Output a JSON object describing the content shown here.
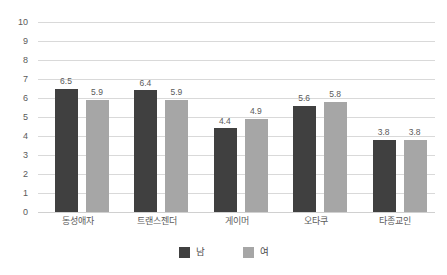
{
  "chart_data": {
    "type": "bar",
    "title": "",
    "subtitle": "",
    "xlabel": "",
    "ylabel": "",
    "ylim": [
      0,
      10
    ],
    "ytick_labels": [
      "10",
      "9",
      "8",
      "7",
      "6",
      "5",
      "4",
      "3",
      "2",
      "1",
      "0"
    ],
    "ytick_values": [
      10,
      9,
      8,
      7,
      6,
      5,
      4,
      3,
      2,
      1,
      0
    ],
    "grid": true,
    "legend_position": "bottom",
    "categories": [
      "동성애자",
      "트랜스젠더",
      "게이머",
      "오타쿠",
      "타종교인"
    ],
    "series": [
      {
        "name": "남",
        "color": "#404040",
        "values": [
          6.5,
          6.4,
          4.4,
          5.6,
          3.8
        ],
        "labels": [
          "6.5",
          "6.4",
          "4.4",
          "5.6",
          "3.8"
        ]
      },
      {
        "name": "여",
        "color": "#a6a6a6",
        "values": [
          5.9,
          5.9,
          4.9,
          5.8,
          3.8
        ],
        "labels": [
          "5.9",
          "5.9",
          "4.9",
          "5.8",
          "3.8"
        ]
      }
    ]
  },
  "colors": {
    "male": "#404040",
    "female": "#a6a6a6",
    "gridline": "#d9d9d9",
    "text": "#5a5a5a",
    "background": "#ffffff"
  },
  "legend": {
    "items": [
      {
        "label": "남",
        "swatch": "male-swatch"
      },
      {
        "label": "여",
        "swatch": "female-swatch"
      }
    ]
  }
}
